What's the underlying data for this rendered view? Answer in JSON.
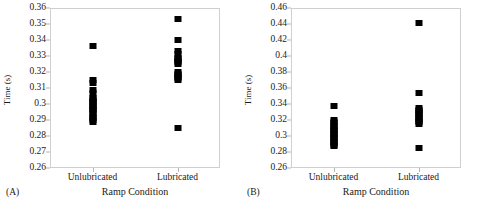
{
  "figure": {
    "width": 481,
    "height": 209,
    "background": "#ffffff",
    "marker_color": "#000000",
    "axis_color": "#cfcfcf"
  },
  "chart_data": [
    {
      "id": "A",
      "type": "scatter",
      "panel_tag": "(A)",
      "title": "",
      "xlabel": "Ramp Condition",
      "ylabel": "Time (s)",
      "categories": [
        "Unlubricated",
        "Lubricated"
      ],
      "ylim": [
        0.26,
        0.36
      ],
      "ytick_step": 0.01,
      "yticks": [
        "0.26",
        "0.27",
        "0.28",
        "0.29",
        "0.3",
        "0.31",
        "0.32",
        "0.33",
        "0.34",
        "0.35",
        "0.36"
      ],
      "ytick_values": [
        0.26,
        0.27,
        0.28,
        0.29,
        0.3,
        0.31,
        0.32,
        0.33,
        0.34,
        0.35,
        0.36
      ],
      "grid": false,
      "legend": "none",
      "series": [
        {
          "name": "Unlubricated",
          "category": "Unlubricated",
          "values": [
            0.336,
            0.315,
            0.313,
            0.309,
            0.307,
            0.304,
            0.303,
            0.302,
            0.301,
            0.3,
            0.299,
            0.298,
            0.297,
            0.296,
            0.295,
            0.294,
            0.292,
            0.291,
            0.29,
            0.289
          ]
        },
        {
          "name": "Lubricated",
          "category": "Lubricated",
          "values": [
            0.353,
            0.34,
            0.333,
            0.331,
            0.329,
            0.328,
            0.327,
            0.326,
            0.325,
            0.32,
            0.319,
            0.318,
            0.317,
            0.316,
            0.315,
            0.285
          ]
        }
      ]
    },
    {
      "id": "B",
      "type": "scatter",
      "panel_tag": "(B)",
      "title": "",
      "xlabel": "Ramp Condition",
      "ylabel": "Time (s)",
      "categories": [
        "Unlubricated",
        "Lubricated"
      ],
      "ylim": [
        0.26,
        0.46
      ],
      "ytick_step": 0.02,
      "yticks": [
        "0.26",
        "0.28",
        "0.3",
        "0.32",
        "0.34",
        "0.36",
        "0.38",
        "0.4",
        "0.42",
        "0.44",
        "0.46"
      ],
      "ytick_values": [
        0.26,
        0.28,
        0.3,
        0.32,
        0.34,
        0.36,
        0.38,
        0.4,
        0.42,
        0.44,
        0.46
      ],
      "grid": false,
      "legend": "none",
      "series": [
        {
          "name": "Unlubricated",
          "category": "Unlubricated",
          "values": [
            0.338,
            0.32,
            0.318,
            0.316,
            0.313,
            0.311,
            0.309,
            0.307,
            0.305,
            0.303,
            0.301,
            0.299,
            0.297,
            0.295,
            0.293,
            0.291,
            0.289,
            0.288
          ]
        },
        {
          "name": "Lubricated",
          "category": "Lubricated",
          "values": [
            0.441,
            0.354,
            0.335,
            0.333,
            0.331,
            0.329,
            0.327,
            0.325,
            0.323,
            0.321,
            0.319,
            0.317,
            0.315,
            0.285
          ]
        }
      ]
    }
  ]
}
